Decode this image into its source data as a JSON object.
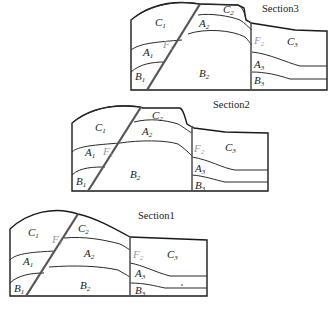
{
  "sections": [
    {
      "title": "Section3",
      "labels": {
        "C1": {
          "base": "C",
          "sub": "1"
        },
        "C2": {
          "base": "C",
          "sub": "2"
        },
        "C3": {
          "base": "C",
          "sub": "3"
        },
        "A1": {
          "base": "A",
          "sub": "1"
        },
        "A2": {
          "base": "A",
          "sub": "2"
        },
        "A3": {
          "base": "A",
          "sub": "3"
        },
        "B1": {
          "base": "B",
          "sub": "1"
        },
        "B2": {
          "base": "B",
          "sub": "2"
        },
        "B3": {
          "base": "B",
          "sub": "3"
        },
        "F1": {
          "base": "F",
          "sub": "1"
        },
        "F2": {
          "base": "F",
          "sub": "2"
        }
      }
    },
    {
      "title": "Section2",
      "labels": {
        "C1": {
          "base": "C",
          "sub": "1"
        },
        "C2": {
          "base": "C",
          "sub": "2"
        },
        "C3": {
          "base": "C",
          "sub": "3"
        },
        "A1": {
          "base": "A",
          "sub": "1"
        },
        "A2": {
          "base": "A",
          "sub": "2"
        },
        "A3": {
          "base": "A",
          "sub": "3"
        },
        "B1": {
          "base": "B",
          "sub": "1"
        },
        "B2": {
          "base": "B",
          "sub": "2"
        },
        "B3": {
          "base": "B",
          "sub": "3"
        },
        "F1": {
          "base": "F",
          "sub": "1"
        },
        "F2": {
          "base": "F",
          "sub": "2"
        }
      }
    },
    {
      "title": "Section1",
      "labels": {
        "C1": {
          "base": "C",
          "sub": "1"
        },
        "C2": {
          "base": "C",
          "sub": "2"
        },
        "C3": {
          "base": "C",
          "sub": "3"
        },
        "A1": {
          "base": "A",
          "sub": "1"
        },
        "A2": {
          "base": "A",
          "sub": "2"
        },
        "A3": {
          "base": "A",
          "sub": "3"
        },
        "B1": {
          "base": "B",
          "sub": "1"
        },
        "B2": {
          "base": "B",
          "sub": "2"
        },
        "B3": {
          "base": "B",
          "sub": "3"
        },
        "F1": {
          "base": "F",
          "sub": "1"
        },
        "F2": {
          "base": "F",
          "sub": "2"
        }
      }
    }
  ]
}
